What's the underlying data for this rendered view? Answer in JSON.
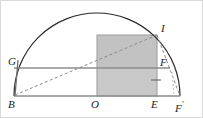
{
  "figure": {
    "background": "#ffffff",
    "border_color": "#d9d9d9",
    "width": 203,
    "height": 118
  },
  "style": {
    "arc_color": "#2b2b2b",
    "solid_line_color": "#8c8c8c",
    "dashed_line_color": "#8a8a8a",
    "rect_fill_upper": "#c2c2c2",
    "rect_fill_lower": "#c8c8c8",
    "rect_stroke": "#9a9a9a",
    "label_color": "#1a1a1a",
    "tick_color": "#707070"
  },
  "geometry": {
    "baseline_y": 96,
    "center_x": 97,
    "radius": 83,
    "arc_left_x": 14,
    "arc_right_x": 180,
    "arc_top_y": 13,
    "rect_left_x": 97,
    "rect_right_x": 157,
    "rect_top_y": 35,
    "rect_bottom_y": 96,
    "chord_y": 68,
    "chord_left_x": 14,
    "chord_right_x": 170
  },
  "points": [
    {
      "name": "B",
      "label": "B",
      "x": 14,
      "y": 96,
      "label_x": 9,
      "label_y": 99
    },
    {
      "name": "O",
      "label": "O",
      "x": 97,
      "y": 96,
      "label_x": 92,
      "label_y": 99
    },
    {
      "name": "E",
      "label": "E",
      "x": 157,
      "y": 96,
      "label_x": 152,
      "label_y": 99
    },
    {
      "name": "Fp",
      "label": "F",
      "prime": "′",
      "x": 180,
      "y": 96,
      "label_x": 176,
      "label_y": 99
    },
    {
      "name": "G",
      "label": "G",
      "x": 17,
      "y": 68,
      "label_x": 9,
      "label_y": 57
    },
    {
      "name": "F",
      "label": "F",
      "x": 157,
      "y": 68,
      "label_x": 160,
      "label_y": 58
    },
    {
      "name": "I",
      "label": "I",
      "x": 157,
      "y": 35,
      "label_x": 160,
      "label_y": 24
    }
  ],
  "segments": [
    {
      "name": "baseline-B-Fprime",
      "kind": "solid",
      "x1": 14,
      "y1": 96,
      "x2": 180,
      "y2": 96
    },
    {
      "name": "chord-G-F",
      "kind": "solid",
      "x1": 14,
      "y1": 68,
      "x2": 170,
      "y2": 68
    },
    {
      "name": "vertical-B-G",
      "kind": "solid",
      "x1": 15,
      "y1": 96,
      "x2": 18,
      "y2": 62
    },
    {
      "name": "diagonal-B-I",
      "kind": "dashed",
      "x1": 15,
      "y1": 95,
      "x2": 157,
      "y2": 35
    },
    {
      "name": "diagonal-I-Fprime",
      "kind": "dashed",
      "x1": 157,
      "y1": 35,
      "x2": 180,
      "y2": 96
    },
    {
      "name": "vertical-guide-Fprime",
      "kind": "dashed-faint",
      "x1": 172,
      "y1": 73,
      "x2": 174,
      "y2": 94
    }
  ],
  "ticks": [
    {
      "name": "tick-right-edge",
      "x1": 151,
      "y1": 80,
      "x2": 161,
      "y2": 80
    }
  ],
  "labels_note": "B, O, E, F-prime on baseline; G on left, F mid-right, I on arc"
}
